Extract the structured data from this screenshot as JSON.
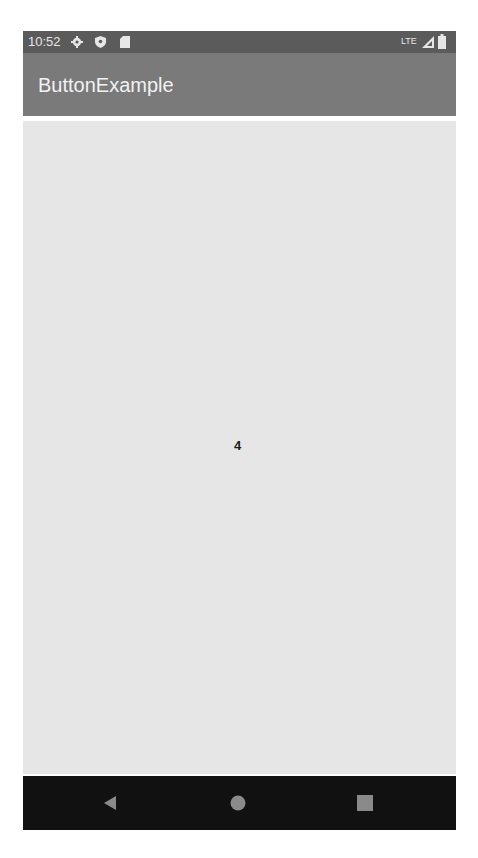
{
  "status_bar": {
    "time": "10:52",
    "left_icons": [
      "settings-icon",
      "shield-icon",
      "sd-card-icon"
    ],
    "network": "LTE",
    "right_icons": [
      "signal-icon",
      "battery-icon"
    ]
  },
  "app_bar": {
    "title": "ButtonExample"
  },
  "content": {
    "counter_value": "4"
  },
  "nav_bar": {
    "buttons": [
      "back",
      "home",
      "recents"
    ]
  },
  "colors": {
    "status_bar": "#5b5b5b",
    "app_bar": "#7a7a7a",
    "content_bg": "#e6e6e6",
    "nav_bar": "#111111",
    "nav_icon": "#8a8a8a"
  }
}
